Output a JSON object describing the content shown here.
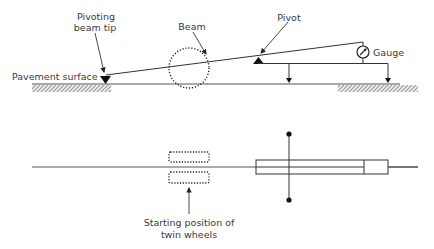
{
  "diagram": {
    "side_view": {
      "labels": {
        "pivoting_beam_tip_line1": "Pivoting",
        "pivoting_beam_tip_line2": "beam tip",
        "beam": "Beam",
        "pivot": "Pivot",
        "gauge": "Gauge",
        "pavement_surface": "Pavement surface"
      }
    },
    "plan_view": {
      "labels": {
        "starting_position_line1": "Starting position of",
        "starting_position_line2": "twin wheels"
      }
    },
    "colors": {
      "line": "#333333",
      "text": "#3a3a3a",
      "background": "#ffffff"
    }
  }
}
